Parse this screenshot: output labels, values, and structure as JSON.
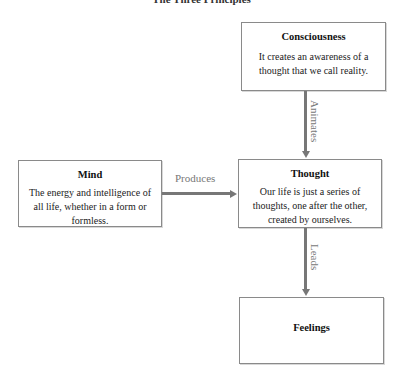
{
  "diagram": {
    "title": "The Three Principles",
    "nodes": {
      "consciousness": {
        "heading": "Consciousness",
        "text": "It creates an awareness of a thought that we call reality."
      },
      "mind": {
        "heading": "Mind",
        "text": "The energy and intelligence of all life, whether in a form or formless."
      },
      "thought": {
        "heading": "Thought",
        "text": "Our life is just a series of thoughts, one after the other, created by ourselves."
      },
      "feelings": {
        "heading": "Feelings"
      }
    },
    "edges": [
      {
        "from": "consciousness",
        "to": "thought",
        "label": "Animates"
      },
      {
        "from": "mind",
        "to": "thought",
        "label": "Produces"
      },
      {
        "from": "thought",
        "to": "feelings",
        "label": "Leads"
      }
    ],
    "colors": {
      "box_border": "#8a8a8a",
      "arrow": "#777777",
      "label": "#777777"
    }
  }
}
